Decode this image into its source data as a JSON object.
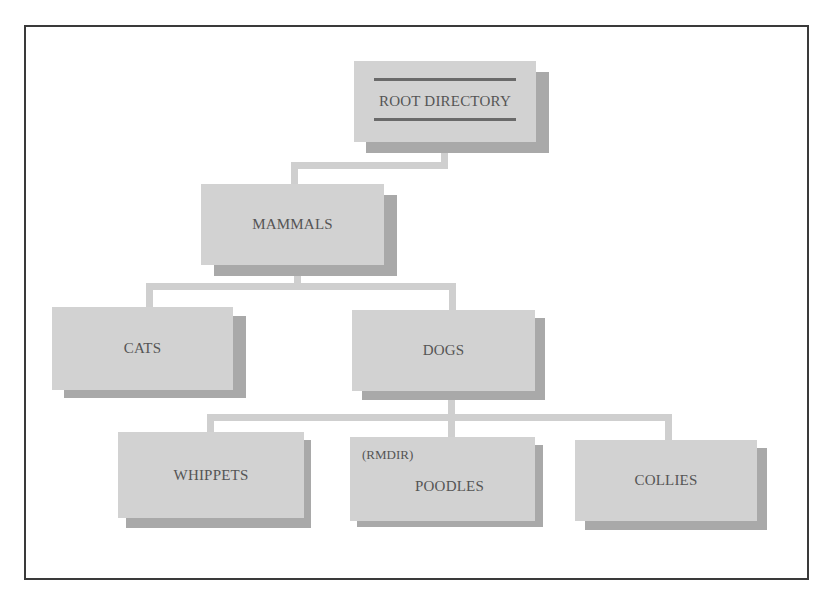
{
  "diagram": {
    "colors": {
      "box_fill": "#d2d2d2",
      "box_shadow": "#a9a9a9",
      "connector": "#cfcfcf",
      "text": "#555555",
      "frame": "#3a3a3a"
    },
    "nodes": [
      {
        "id": "root",
        "label": "ROOT DIRECTORY",
        "parent": null
      },
      {
        "id": "mammals",
        "label": "MAMMALS",
        "parent": "root"
      },
      {
        "id": "cats",
        "label": "CATS",
        "parent": "mammals"
      },
      {
        "id": "dogs",
        "label": "DOGS",
        "parent": "mammals"
      },
      {
        "id": "whippets",
        "label": "WHIPPETS",
        "parent": "dogs"
      },
      {
        "id": "poodles",
        "label": "POODLES",
        "parent": "dogs",
        "annotation": "(RMDIR)"
      },
      {
        "id": "collies",
        "label": "COLLIES",
        "parent": "dogs"
      }
    ]
  }
}
